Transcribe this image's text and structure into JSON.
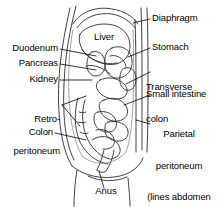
{
  "figure": {
    "background_color": "#ffffff",
    "line_color": "#1a1a1a",
    "text_color": "#000000",
    "organ_shade_color": "#9a9a9a"
  },
  "labels": {
    "liver": "Liver",
    "diaphragm": "Diaphragm",
    "stomach": "Stomach",
    "transverse_colon_line1": "Transverse",
    "transverse_colon_line2": "colon",
    "small_intestine": "Small intestine",
    "parietal_peritoneum_line1": "Parietal",
    "parietal_peritoneum_line2": "peritoneum",
    "parietal_peritoneum_line3": "(lines abdomen",
    "parietal_peritoneum_line4": "and pelvis)",
    "duodenum": "Duodenum",
    "pancreas": "Pancreas",
    "kidney": "Kidney",
    "retroperitoneum_line1": "Retro-",
    "retroperitoneum_line2": "peritoneum",
    "colon": "Colon",
    "anus": "Anus"
  }
}
